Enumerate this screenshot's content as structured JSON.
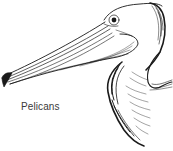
{
  "illustration": {
    "subject": "pelican-head",
    "style": "pen-and-ink line drawing",
    "ink_color": "#1a1a1a",
    "background": "#ffffff"
  },
  "caption": {
    "text": "Pelicans"
  }
}
